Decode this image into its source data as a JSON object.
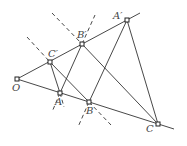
{
  "diagram": {
    "type": "geometry",
    "colors": {
      "line": "#333333",
      "point_fill": "#ffffff",
      "label": "#444444"
    },
    "points": {
      "O": {
        "label": "O",
        "x": 17,
        "y": 79
      },
      "A": {
        "label": "A",
        "x": 60,
        "y": 93
      },
      "B": {
        "label": "B",
        "x": 89,
        "y": 102
      },
      "C": {
        "label": "C",
        "x": 158,
        "y": 124
      },
      "C_prime": {
        "label": "C′",
        "x": 50,
        "y": 62
      },
      "B_prime": {
        "label": "B′",
        "x": 82,
        "y": 44
      },
      "A_prime": {
        "label": "A′",
        "x": 127,
        "y": 20
      }
    },
    "solid_segments": [
      [
        "O",
        "C_ext"
      ],
      [
        "O",
        "A_prime_ext"
      ],
      [
        "A_prime",
        "C"
      ],
      [
        "A_prime",
        "B"
      ],
      [
        "B_prime",
        "C"
      ],
      [
        "B_prime",
        "A"
      ],
      [
        "C_prime",
        "B"
      ],
      [
        "C_prime",
        "A"
      ]
    ],
    "dashed_lines": [
      "through C′ A",
      "through B′ B",
      "through A B′"
    ]
  }
}
